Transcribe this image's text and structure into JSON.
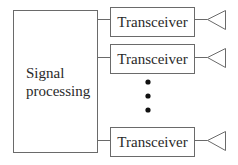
{
  "diagram": {
    "type": "block-diagram",
    "signal_processing": {
      "label_lines": [
        "Signal",
        "processing"
      ]
    },
    "transceivers": [
      {
        "label": "Transceiver",
        "antenna": "antenna-icon"
      },
      {
        "label": "Transceiver",
        "antenna": "antenna-icon"
      },
      {
        "label": "Transceiver",
        "antenna": "antenna-icon"
      }
    ],
    "ellipsis": "vertical-dots",
    "colors": {
      "stroke": "#6a6a6a",
      "text": "#2a2a2a",
      "dots": "#111111"
    }
  }
}
